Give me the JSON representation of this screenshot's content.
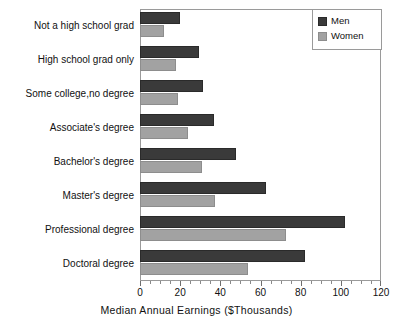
{
  "chart_data": {
    "type": "bar",
    "orientation": "horizontal",
    "title": "",
    "xlabel": "Median Annual Earnings  ($Thousands)",
    "ylabel": "",
    "xlim": [
      0,
      120
    ],
    "xticks": [
      0,
      20,
      40,
      60,
      80,
      100,
      120
    ],
    "xtick_labels": [
      "0",
      "20",
      "40",
      "60",
      "80",
      "100",
      "120"
    ],
    "minor_tick_step": 5,
    "grid": false,
    "legend_position": "top-right",
    "categories": [
      "Not a high school grad",
      "High school grad only",
      "Some college,no degree",
      "Associate's degree",
      "Bachelor's degree",
      "Master's degree",
      "Professional degree",
      "Doctoral degree"
    ],
    "series": [
      {
        "name": "Men",
        "color": "#3a3a3a",
        "values": [
          20,
          29.5,
          31.5,
          37,
          48,
          62.5,
          102,
          82
        ]
      },
      {
        "name": "Women",
        "color": "#a2a2a2",
        "values": [
          12,
          18,
          19,
          24,
          31,
          37.5,
          72.5,
          54
        ]
      }
    ]
  },
  "legend": {
    "items": [
      {
        "label": "Men",
        "key": "men"
      },
      {
        "label": "Women",
        "key": "women"
      }
    ]
  }
}
